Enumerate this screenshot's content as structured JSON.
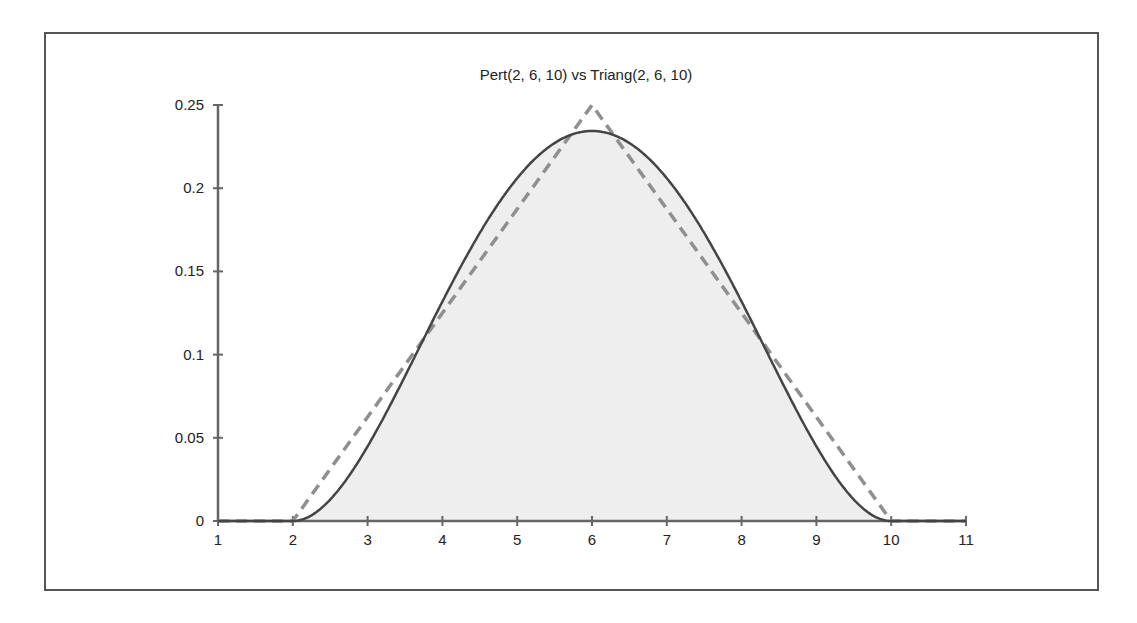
{
  "chart_data": {
    "type": "line",
    "title": "Pert(2, 6, 10) vs Triang(2, 6, 10)",
    "xlabel": "",
    "ylabel": "",
    "xlim": [
      1,
      11
    ],
    "ylim": [
      0,
      0.25
    ],
    "x_ticks": [
      "1",
      "2",
      "3",
      "4",
      "5",
      "6",
      "7",
      "8",
      "9",
      "10",
      "11"
    ],
    "y_ticks": [
      "0",
      "0.05",
      "0.1",
      "0.15",
      "0.2",
      "0.25"
    ],
    "grid": false,
    "legend": null,
    "series": [
      {
        "name": "Pert(2, 6, 10)",
        "style": "solid",
        "filled": true,
        "x": [
          1,
          2,
          2.5,
          3,
          3.5,
          4,
          4.5,
          5,
          5.5,
          6,
          6.5,
          7,
          7.5,
          8,
          8.5,
          9,
          9.5,
          10,
          11
        ],
        "values": [
          0,
          0,
          0.0132,
          0.0449,
          0.0848,
          0.1318,
          0.1683,
          0.206,
          0.2262,
          0.2344,
          0.2262,
          0.206,
          0.1683,
          0.1318,
          0.0848,
          0.0449,
          0.0132,
          0,
          0
        ]
      },
      {
        "name": "Triang(2, 6, 10)",
        "style": "dashed",
        "filled": false,
        "x": [
          1,
          2,
          6,
          10,
          11
        ],
        "values": [
          0,
          0,
          0.25,
          0,
          0
        ]
      }
    ]
  },
  "colors": {
    "pert_line": "#444444",
    "pert_fill": "#eeeeee",
    "triang_line": "#8f8f8f",
    "axis": "#666666",
    "frame": "#555555",
    "text": "#222222"
  }
}
